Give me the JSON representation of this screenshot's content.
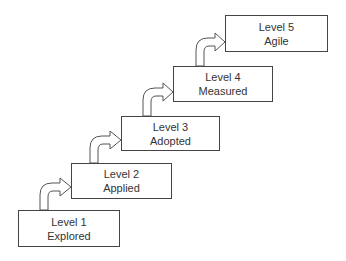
{
  "diagram": {
    "type": "staircase maturity model",
    "levels": [
      {
        "level": "Level 1",
        "name": "Explored",
        "box": {
          "x": 18,
          "y": 210,
          "w": 102,
          "h": 37
        }
      },
      {
        "level": "Level 2",
        "name": "Applied",
        "box": {
          "x": 71,
          "y": 163,
          "w": 101,
          "h": 36
        }
      },
      {
        "level": "Level 3",
        "name": "Adopted",
        "box": {
          "x": 121,
          "y": 116,
          "w": 99,
          "h": 35
        }
      },
      {
        "level": "Level 4",
        "name": "Measured",
        "box": {
          "x": 173,
          "y": 66,
          "w": 100,
          "h": 36
        }
      },
      {
        "level": "Level 5",
        "name": "Agile",
        "box": {
          "x": 225,
          "y": 15,
          "w": 103,
          "h": 37
        }
      }
    ],
    "connector": "curved up-and-right hollow arrow between consecutive levels"
  }
}
